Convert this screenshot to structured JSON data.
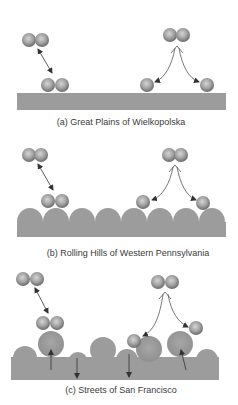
{
  "figure": {
    "panels": [
      {
        "id": "a",
        "caption": "(a) Great Plains of Wielkopolska",
        "surface": "flat"
      },
      {
        "id": "b",
        "caption": "(b) Rolling Hills of Western Pennsylvania",
        "surface": "bumpy"
      },
      {
        "id": "c",
        "caption": "(c) Streets of San Francisco",
        "surface": "rough with raised and sunken atoms"
      }
    ],
    "colors": {
      "atom_light": "#c8c8c8",
      "atom_dark": "#6e6e6e",
      "surface": "#9c9c9c",
      "arrow": "#333333",
      "caption": "#3a3a3a"
    }
  }
}
